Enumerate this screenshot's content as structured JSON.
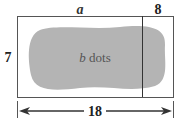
{
  "labels": {
    "top_left": "a",
    "top_right": "8",
    "left": "7",
    "center_var": "b",
    "center_text": " dots",
    "bottom": "18"
  },
  "colors": {
    "blob": "#b4b4b4",
    "line": "#333333"
  }
}
